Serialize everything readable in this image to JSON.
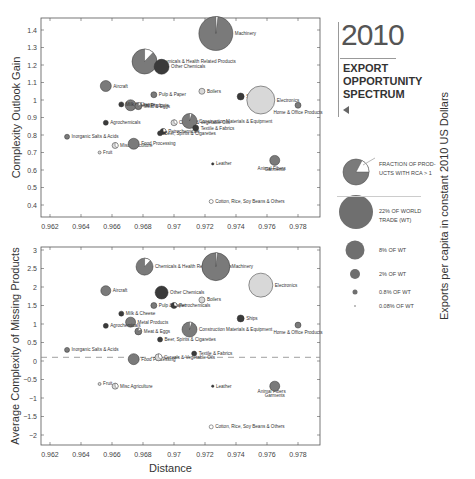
{
  "title": {
    "year": "2010",
    "subtitle_lines": [
      "EXPORT",
      "OPPORTUNITY",
      "SPECTRUM"
    ]
  },
  "side_label": "Exports per capita in constant 2010 US Dollars",
  "legend": {
    "fraction_label": "FRACTION OF PROD-UCTS WITH RCA > 1",
    "fraction_line1": "FRACTION OF PROD-",
    "fraction_line2": "UCTS WITH RCA > 1",
    "sizes": [
      {
        "label_line1": "22% OF WORLD",
        "label_line2": "TRADE (WT)",
        "pct": 22
      },
      {
        "label_line1": "8% OF WT",
        "label_line2": "",
        "pct": 8
      },
      {
        "label_line1": "2% OF WT",
        "label_line2": "",
        "pct": 2
      },
      {
        "label_line1": "0.8% OF WT",
        "label_line2": "",
        "pct": 0.8
      },
      {
        "label_line1": "0.08% OF WT",
        "label_line2": "",
        "pct": 0.08
      }
    ]
  },
  "colors": {
    "dark": "#3a3a3a",
    "mid": "#7a7a7a",
    "light": "#d8d8d8",
    "frame": "#555555"
  },
  "chart_data": [
    {
      "type": "scatter",
      "title": "",
      "xlabel": "",
      "ylabel": "Complexity Outlook Gain",
      "xlim": [
        0.961,
        0.9795
      ],
      "ylim": [
        0.32,
        1.47
      ],
      "x_ticks": [
        "0.962",
        "0.964",
        "0.966",
        "0.968",
        "0.97",
        "0.972",
        "0.974",
        "0.976",
        "0.978"
      ],
      "y_ticks": [
        "0.4",
        "0.5",
        "0.6",
        "0.7",
        "0.8",
        "0.9",
        "1",
        "1.1",
        "1.2",
        "1.3",
        "1.4"
      ],
      "grid": false,
      "points": [
        {
          "name": "Machinery",
          "x": 0.9727,
          "y": 1.38,
          "r": 17,
          "shade": "mid",
          "rca_frac": 0.02
        },
        {
          "name": "Chemicals & Health Related Products",
          "x": 0.9681,
          "y": 1.22,
          "r": 12.5,
          "shade": "mid",
          "rca_frac": 0.12
        },
        {
          "name": "Other Chemicals",
          "x": 0.9692,
          "y": 1.19,
          "r": 7.5,
          "shade": "dark",
          "rca_frac": 0
        },
        {
          "name": "Aircraft",
          "x": 0.9656,
          "y": 1.08,
          "r": 5.5,
          "shade": "mid",
          "rca_frac": 0
        },
        {
          "name": "Metal Products",
          "x": 0.9672,
          "y": 0.97,
          "r": 5.5,
          "shade": "mid",
          "rca_frac": 0
        },
        {
          "name": "Milk & Cheese",
          "x": 0.9666,
          "y": 0.975,
          "r": 2.5,
          "shade": "dark",
          "rca_frac": 0
        },
        {
          "name": "Meat & Eggs",
          "x": 0.9677,
          "y": 0.965,
          "r": 3.5,
          "shade": "mid",
          "rca_frac": 0.15
        },
        {
          "name": "Pulp & Paper",
          "x": 0.9687,
          "y": 1.03,
          "r": 3,
          "shade": "mid",
          "rca_frac": 0
        },
        {
          "name": "Boilers",
          "x": 0.9718,
          "y": 1.05,
          "r": 3,
          "shade": "light",
          "rca_frac": 0
        },
        {
          "name": "Ships",
          "x": 0.9743,
          "y": 1.02,
          "r": 3.5,
          "shade": "dark",
          "rca_frac": 0
        },
        {
          "name": "Electronics",
          "x": 0.9756,
          "y": 1.0,
          "r": 14,
          "shade": "light",
          "rca_frac": 0
        },
        {
          "name": "Home & Office Products",
          "x": 0.978,
          "y": 0.97,
          "r": 3,
          "shade": "mid",
          "rca_frac": 0
        },
        {
          "name": "Agrochemicals",
          "x": 0.9656,
          "y": 0.87,
          "r": 2.5,
          "shade": "dark",
          "rca_frac": 0
        },
        {
          "name": "Cereals & Vegetable Oils",
          "x": 0.97,
          "y": 0.87,
          "r": 3,
          "shade": "light",
          "rca_frac": 0.35
        },
        {
          "name": "Construction Materials & Equipment",
          "x": 0.971,
          "y": 0.88,
          "r": 7.5,
          "shade": "mid",
          "rca_frac": 0.05
        },
        {
          "name": "Petrochemicals",
          "x": 0.9693,
          "y": 0.82,
          "r": 3,
          "shade": "dark",
          "rca_frac": 0.3
        },
        {
          "name": "Textile & Fabrics",
          "x": 0.9714,
          "y": 0.84,
          "r": 3,
          "shade": "dark",
          "rca_frac": 0
        },
        {
          "name": "Beer, Spirits & Cigarettes",
          "x": 0.9691,
          "y": 0.81,
          "r": 2.5,
          "shade": "dark",
          "rca_frac": 0
        },
        {
          "name": "Inorganic Salts & Acids",
          "x": 0.9631,
          "y": 0.79,
          "r": 2.5,
          "shade": "mid",
          "rca_frac": 0
        },
        {
          "name": "Misc Agriculture",
          "x": 0.9662,
          "y": 0.74,
          "r": 3,
          "shade": "light",
          "rca_frac": 0.4
        },
        {
          "name": "Food Processing",
          "x": 0.9674,
          "y": 0.75,
          "r": 5.5,
          "shade": "mid",
          "rca_frac": 0
        },
        {
          "name": "Fruit",
          "x": 0.9652,
          "y": 0.7,
          "r": 1.5,
          "shade": "light",
          "rca_frac": 0
        },
        {
          "name": "Leather",
          "x": 0.9725,
          "y": 0.635,
          "r": 1.2,
          "shade": "dark",
          "rca_frac": 0
        },
        {
          "name": "Animal Fibers",
          "x": 0.9763,
          "y": 0.64,
          "r": 0.8,
          "shade": "dark",
          "rca_frac": 0
        },
        {
          "name": "Garments",
          "x": 0.9765,
          "y": 0.655,
          "r": 5,
          "shade": "mid",
          "rca_frac": 0
        },
        {
          "name": "Cotton, Rice, Soy Beans & Others",
          "x": 0.9724,
          "y": 0.42,
          "r": 2,
          "shade": "white",
          "rca_frac": 0
        }
      ]
    },
    {
      "type": "scatter",
      "title": "",
      "xlabel": "Distance",
      "ylabel": "Average Complexity of Missing Products",
      "xlim": [
        0.961,
        0.9795
      ],
      "ylim": [
        -2.3,
        3.05
      ],
      "x_ticks": [
        "0.962",
        "0.964",
        "0.966",
        "0.968",
        "0.97",
        "0.972",
        "0.974",
        "0.976",
        "0.978"
      ],
      "y_ticks": [
        "3",
        "2.5",
        "2",
        "1.5",
        "1",
        "0.5",
        "0",
        "-0.5",
        "-1",
        "-1.5",
        "-2"
      ],
      "reference_line_y": 0.1,
      "grid": false,
      "points": [
        {
          "name": "Chemicals & Health Related Products",
          "x": 0.9681,
          "y": 2.55,
          "r": 8.5,
          "shade": "mid",
          "rca_frac": 0.12
        },
        {
          "name": "Machinery",
          "x": 0.9727,
          "y": 2.55,
          "r": 14,
          "shade": "mid",
          "rca_frac": 0.02
        },
        {
          "name": "Aircraft",
          "x": 0.9656,
          "y": 1.9,
          "r": 5,
          "shade": "mid",
          "rca_frac": 0
        },
        {
          "name": "Other Chemicals",
          "x": 0.9692,
          "y": 1.85,
          "r": 6.5,
          "shade": "dark",
          "rca_frac": 0
        },
        {
          "name": "Electronics",
          "x": 0.9756,
          "y": 2.05,
          "r": 12,
          "shade": "light",
          "rca_frac": 0
        },
        {
          "name": "Pulp & Paper",
          "x": 0.9687,
          "y": 1.5,
          "r": 3,
          "shade": "mid",
          "rca_frac": 0
        },
        {
          "name": "Petrochemicals",
          "x": 0.97,
          "y": 1.5,
          "r": 3,
          "shade": "dark",
          "rca_frac": 0.3
        },
        {
          "name": "Boilers",
          "x": 0.9718,
          "y": 1.65,
          "r": 3,
          "shade": "light",
          "rca_frac": 0
        },
        {
          "name": "Milk & Cheese",
          "x": 0.9666,
          "y": 1.28,
          "r": 2.5,
          "shade": "dark",
          "rca_frac": 0
        },
        {
          "name": "Ships",
          "x": 0.9743,
          "y": 1.15,
          "r": 3.5,
          "shade": "dark",
          "rca_frac": 0
        },
        {
          "name": "Home & Office Products",
          "x": 0.978,
          "y": 0.97,
          "r": 3,
          "shade": "mid",
          "rca_frac": 0
        },
        {
          "name": "Metal Products",
          "x": 0.9672,
          "y": 1.05,
          "r": 5,
          "shade": "mid",
          "rca_frac": 0
        },
        {
          "name": "Agrochemicals",
          "x": 0.9656,
          "y": 0.95,
          "r": 2.5,
          "shade": "dark",
          "rca_frac": 0
        },
        {
          "name": "Meat & Eggs",
          "x": 0.9677,
          "y": 0.8,
          "r": 3.5,
          "shade": "mid",
          "rca_frac": 0.15
        },
        {
          "name": "Construction Materials & Equipment",
          "x": 0.971,
          "y": 0.85,
          "r": 7.5,
          "shade": "mid",
          "rca_frac": 0.05
        },
        {
          "name": "Beer, Spirits & Cigarettes",
          "x": 0.9691,
          "y": 0.58,
          "r": 2.5,
          "shade": "dark",
          "rca_frac": 0
        },
        {
          "name": "Inorganic Salts & Acids",
          "x": 0.9631,
          "y": 0.3,
          "r": 2.5,
          "shade": "mid",
          "rca_frac": 0
        },
        {
          "name": "Food Processing",
          "x": 0.9674,
          "y": 0.05,
          "r": 5.5,
          "shade": "mid",
          "rca_frac": 0
        },
        {
          "name": "Cereals & Vegetable Oils",
          "x": 0.969,
          "y": 0.1,
          "r": 3.5,
          "shade": "light",
          "rca_frac": 0.35
        },
        {
          "name": "Textile & Fabrics",
          "x": 0.9713,
          "y": 0.2,
          "r": 2.5,
          "shade": "dark",
          "rca_frac": 0
        },
        {
          "name": "Fruit",
          "x": 0.9652,
          "y": -0.62,
          "r": 1.5,
          "shade": "light",
          "rca_frac": 0
        },
        {
          "name": "Misc Agriculture",
          "x": 0.9662,
          "y": -0.68,
          "r": 3,
          "shade": "light",
          "rca_frac": 0.4
        },
        {
          "name": "Leather",
          "x": 0.9725,
          "y": -0.68,
          "r": 1.2,
          "shade": "dark",
          "rca_frac": 0
        },
        {
          "name": "Animal Fibers",
          "x": 0.9763,
          "y": -0.68,
          "r": 0.8,
          "shade": "dark",
          "rca_frac": 0
        },
        {
          "name": "Garments",
          "x": 0.9765,
          "y": -0.68,
          "r": 5,
          "shade": "mid",
          "rca_frac": 0
        },
        {
          "name": "Cotton, Rice, Soy Beans & Others",
          "x": 0.9724,
          "y": -1.78,
          "r": 2,
          "shade": "white",
          "rca_frac": 0
        }
      ]
    }
  ]
}
